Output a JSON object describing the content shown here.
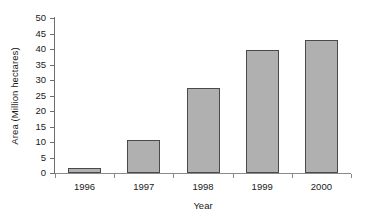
{
  "chart_data": {
    "type": "bar",
    "title": "",
    "categories": [
      "1996",
      "1997",
      "1998",
      "1999",
      "2000"
    ],
    "values": [
      1.6,
      10.8,
      27.5,
      39.7,
      42.8
    ],
    "xlabel": "Year",
    "ylabel": "Area (Million hectares)",
    "ylim": [
      0,
      50
    ],
    "ytick_step": 5,
    "yticks": [
      "0",
      "5",
      "10",
      "15",
      "20",
      "25",
      "30",
      "35",
      "40",
      "45",
      "50"
    ],
    "grid": false,
    "legend": false,
    "legend_position": "none",
    "bar_fill_color": "#b0b0b0",
    "bar_border_color": "#4a4a4a",
    "axis_color": "#6e6e6e",
    "background_color": "#ffffff",
    "text_color": "#1a1a1a"
  }
}
